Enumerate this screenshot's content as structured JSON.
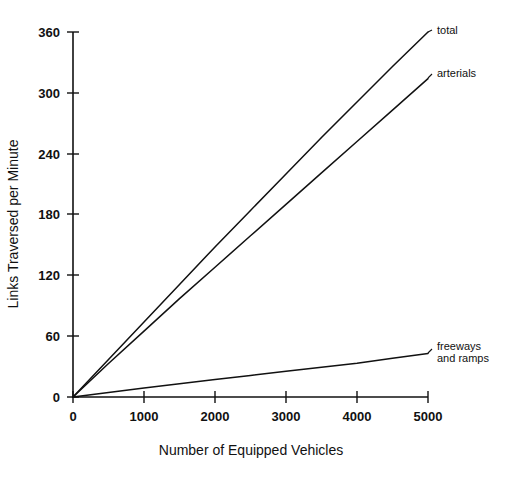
{
  "chart_data": {
    "type": "line",
    "title": "",
    "xlabel": "Number of Equipped Vehicles",
    "ylabel": "Links Traversed per Minute",
    "xlim": [
      0,
      5000
    ],
    "ylim": [
      0,
      360
    ],
    "grid": false,
    "legend_position": "inline-right-labels",
    "xticks": [
      "0",
      "1000",
      "2000",
      "3000",
      "4000",
      "5000"
    ],
    "xtick_values": [
      0,
      1000,
      2000,
      3000,
      4000,
      5000
    ],
    "yticks": [
      "0",
      "60",
      "120",
      "180",
      "240",
      "300",
      "360"
    ],
    "ytick_values": [
      0,
      60,
      120,
      180,
      240,
      300,
      360
    ],
    "x": [
      0,
      500,
      1000,
      1500,
      2000,
      2500,
      3000,
      3500,
      4000,
      4500,
      5000
    ],
    "series": [
      {
        "name": "total",
        "label": "total",
        "color": "#111111",
        "values": [
          0,
          37,
          74,
          111,
          148,
          184,
          220,
          256,
          291,
          326,
          360
        ]
      },
      {
        "name": "arterials",
        "label": "arterials",
        "color": "#111111",
        "values": [
          0,
          33,
          65,
          97,
          128,
          159,
          190,
          221,
          252,
          283,
          314
        ]
      },
      {
        "name": "freeways_and_ramps",
        "label": "freeways and ramps",
        "label_line1": "freeways",
        "label_line2": "and ramps",
        "color": "#111111",
        "values": [
          0,
          4.5,
          8.8,
          13.0,
          17.2,
          21.3,
          25.4,
          29.4,
          33.4,
          38.3,
          43.0
        ]
      }
    ]
  },
  "axis": {
    "x_title": "Number of Equipped Vehicles",
    "y_title": "Links Traversed per Minute"
  },
  "colors": {
    "ink": "#111111",
    "background": "#ffffff"
  }
}
